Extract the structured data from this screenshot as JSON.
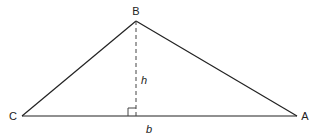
{
  "diagram": {
    "vertices": [
      {
        "name": "B",
        "x": 136,
        "y": 21
      },
      {
        "name": "C",
        "x": 22,
        "y": 116
      },
      {
        "name": "A",
        "x": 297,
        "y": 116
      }
    ],
    "labels": {
      "B": "B",
      "C": "C",
      "A": "A",
      "height": "h",
      "base": "b"
    },
    "colors": {
      "line": "#222222",
      "dashed": "#444444"
    }
  }
}
